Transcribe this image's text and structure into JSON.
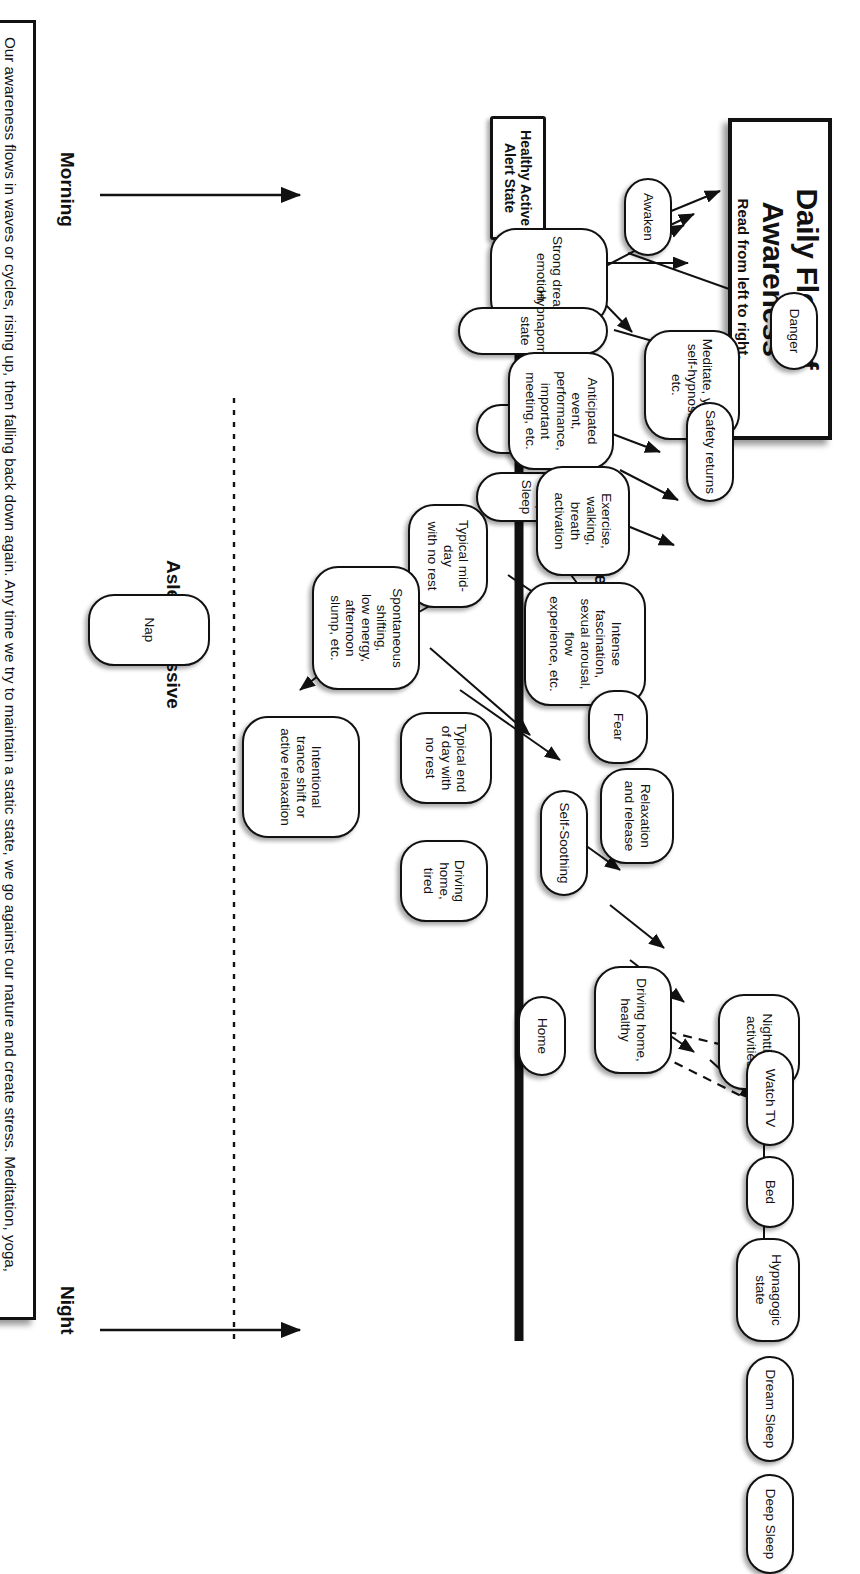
{
  "title": {
    "main": "Daily Flow of Awareness",
    "sub": "Read from left to right."
  },
  "axis_labels": {
    "top": "Hyper-Alert / Active",
    "bottom": "Asleep / Passive"
  },
  "time_labels": {
    "morning": "Morning",
    "night": "Night"
  },
  "note": "Our awareness flows in waves or cycles, rising up, then falling back down again. Any time we try to maintain a static state, we go against our nature and create stress. Meditation, yoga, self-hypnosis, naps, and other inward, passive activities regenerate our energy and return us to the active, alert state which is our healthy baseline.",
  "baseline_node": "Healthy Active\nAlert State",
  "nodes": [
    {
      "id": "awaken",
      "label": "Awaken"
    },
    {
      "id": "strong-dream-emotion",
      "label": "Strong dream\nemotion"
    },
    {
      "id": "hypnapompic",
      "label": "Hypnapompic state"
    },
    {
      "id": "dream-sleep-am",
      "label": "Dream Sleep"
    },
    {
      "id": "deep-sleep-am",
      "label": "Deep Sleep"
    },
    {
      "id": "meditate-yoga",
      "label": "Meditate, yoga,\nself-hypnosis, etc."
    },
    {
      "id": "danger",
      "label": "Danger"
    },
    {
      "id": "anticipated-event",
      "label": "Anticipated event,\nperformance, important\nmeeting, etc."
    },
    {
      "id": "safety-returns",
      "label": "Safety returns"
    },
    {
      "id": "exercise",
      "label": "Exercise, walking,\nbreath activation"
    },
    {
      "id": "typical-midday",
      "label": "Typical mid-day\nwith no rest"
    },
    {
      "id": "spontaneous-shifting",
      "label": "Spontaneous shifting,\nlow energy, afternoon\nslump, etc."
    },
    {
      "id": "nap",
      "label": "Nap"
    },
    {
      "id": "intentional-trance",
      "label": "Intentional\ntrance shift or\nactive relaxation"
    },
    {
      "id": "intense-fascination",
      "label": "Intense fascination,\nsexual arousal, flow\nexperience, etc."
    },
    {
      "id": "fear",
      "label": "Fear"
    },
    {
      "id": "relaxation",
      "label": "Relaxation\nand release"
    },
    {
      "id": "self-soothing",
      "label": "Self-Soothing"
    },
    {
      "id": "typical-end-of-day",
      "label": "Typical end\nof day with\nno rest"
    },
    {
      "id": "driving-home-tired",
      "label": "Driving\nhome,\ntired"
    },
    {
      "id": "driving-home-healthy",
      "label": "Driving home,\nhealthy"
    },
    {
      "id": "nighttime-activities",
      "label": "Nighttime\nactivities"
    },
    {
      "id": "home",
      "label": "Home"
    },
    {
      "id": "watch-tv",
      "label": "Watch TV"
    },
    {
      "id": "bed",
      "label": "Bed"
    },
    {
      "id": "hypnagogic",
      "label": "Hypnagogic\nstate"
    },
    {
      "id": "dream-sleep-pm",
      "label": "Dream Sleep"
    },
    {
      "id": "deep-sleep-pm",
      "label": "Deep Sleep"
    }
  ],
  "colors": {
    "stroke": "#111111",
    "background": "#ffffff"
  }
}
